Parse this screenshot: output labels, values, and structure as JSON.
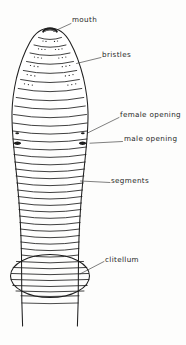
{
  "figure": {
    "orientation": "dorsal-anterior-view",
    "line_color": "#1f1f1f",
    "fill_color": "#ffffff",
    "background_color": "#fdfdfc",
    "labels": [
      {
        "id": "mouth",
        "text": "mouth",
        "x": 72,
        "y": 16,
        "leader": {
          "x1": 70,
          "y1": 23,
          "x2": 53,
          "y2": 32
        }
      },
      {
        "id": "bristles",
        "text": "bristles",
        "x": 102,
        "y": 51,
        "leader": {
          "x1": 100,
          "y1": 57,
          "x2": 76,
          "y2": 63
        }
      },
      {
        "id": "female-opening",
        "text": "female opening",
        "x": 120,
        "y": 111,
        "leader": {
          "x1": 118,
          "y1": 118,
          "x2": 87,
          "y2": 133
        }
      },
      {
        "id": "male-opening",
        "text": "male opening",
        "x": 124,
        "y": 135,
        "leader": {
          "x1": 121,
          "y1": 141,
          "x2": 90,
          "y2": 143
        }
      },
      {
        "id": "segments",
        "text": "segments",
        "x": 111,
        "y": 177,
        "leader": {
          "x1": 109,
          "y1": 183,
          "x2": 80,
          "y2": 181
        }
      },
      {
        "id": "clitellum",
        "text": "clitellum",
        "x": 105,
        "y": 256,
        "leader": {
          "x1": 103,
          "y1": 262,
          "x2": 80,
          "y2": 275
        }
      }
    ],
    "parts": {
      "mouth": {
        "description": "dark crescent lip at apex of head",
        "cx": 50,
        "cy": 31
      },
      "bristles": {
        "description": "paired dot clusters on anterior segments",
        "rows": 6
      },
      "female_opening": {
        "left": {
          "x": 17,
          "y": 133
        },
        "right": {
          "x": 83,
          "y": 133
        }
      },
      "male_opening": {
        "left": {
          "x": 17,
          "y": 143
        },
        "right": {
          "x": 83,
          "y": 143
        }
      },
      "segments": {
        "count": 35,
        "description": "transverse annuli across body"
      },
      "clitellum": {
        "description": "saddle band ellipse",
        "cx": 50,
        "cy": 275,
        "rx": 40,
        "ry": 21
      }
    }
  }
}
